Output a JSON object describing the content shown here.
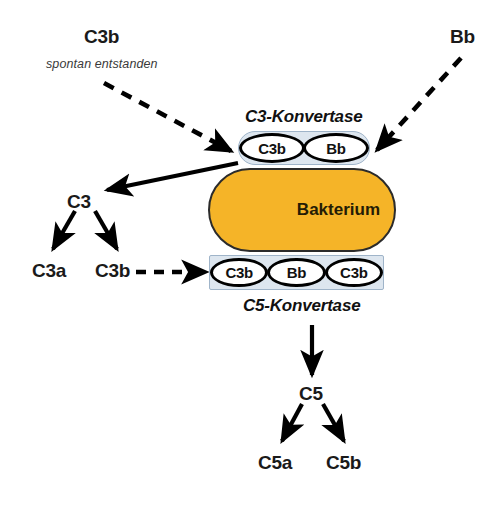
{
  "diagram": {
    "language": "de",
    "colors": {
      "bacterium_fill": "#F5B428",
      "bacterium_stroke": "#2b2b2b",
      "complex_fill": "#dde6ef",
      "complex_stroke": "#9fb4c9",
      "arrow": "#000000",
      "text": "#1a1a1a",
      "background": "#ffffff"
    },
    "labels": {
      "c3b_top": "C3b",
      "c3b_top_note": "spontan entstanden",
      "bb_top": "Bb",
      "c3_konvertase": "C3-Konvertase",
      "c5_konvertase": "C5-Konvertase",
      "bacterium": "Bakterium",
      "c3": "C3",
      "c3a": "C3a",
      "c3b_cleaved": "C3b",
      "c5": "C5",
      "c5a": "C5a",
      "c5b": "C5b"
    },
    "c3_konvertase_subunits": [
      "C3b",
      "Bb"
    ],
    "c5_konvertase_subunits": [
      "C3b",
      "Bb",
      "C3b"
    ],
    "edges": [
      {
        "name": "c3b-to-c3-konvertase",
        "style": "dashed"
      },
      {
        "name": "bb-to-c3-konvertase",
        "style": "dashed"
      },
      {
        "name": "c3-konvertase-cleaves-c3",
        "style": "solid"
      },
      {
        "name": "c3-to-c3a",
        "style": "solid"
      },
      {
        "name": "c3-to-c3b",
        "style": "solid"
      },
      {
        "name": "c3b-to-c5-konvertase",
        "style": "dashed"
      },
      {
        "name": "c5-konvertase-to-c5",
        "style": "solid"
      },
      {
        "name": "c5-to-c5a",
        "style": "solid"
      },
      {
        "name": "c5-to-c5b",
        "style": "solid"
      }
    ]
  }
}
